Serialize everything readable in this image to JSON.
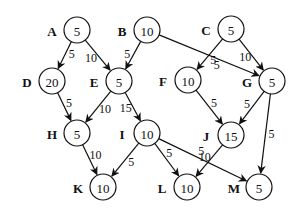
{
  "diagram": {
    "type": "directed-weighted-graph",
    "nodes": [
      {
        "id": "A",
        "label": "A",
        "value": "5"
      },
      {
        "id": "B",
        "label": "B",
        "value": "10"
      },
      {
        "id": "C",
        "label": "C",
        "value": "5"
      },
      {
        "id": "D",
        "label": "D",
        "value": "20"
      },
      {
        "id": "E",
        "label": "E",
        "value": "5"
      },
      {
        "id": "F",
        "label": "F",
        "value": "10"
      },
      {
        "id": "G",
        "label": "G",
        "value": "5"
      },
      {
        "id": "H",
        "label": "H",
        "value": "5"
      },
      {
        "id": "I",
        "label": "I",
        "value": "10"
      },
      {
        "id": "J",
        "label": "J",
        "value": "15"
      },
      {
        "id": "K",
        "label": "K",
        "value": "10"
      },
      {
        "id": "L",
        "label": "L",
        "value": "10"
      },
      {
        "id": "M",
        "label": "M",
        "value": "5"
      }
    ],
    "edges": [
      {
        "from": "A",
        "to": "D",
        "weight": "5"
      },
      {
        "from": "A",
        "to": "E",
        "weight": "10"
      },
      {
        "from": "B",
        "to": "E",
        "weight": "5"
      },
      {
        "from": "B",
        "to": "G",
        "weight": "5"
      },
      {
        "from": "C",
        "to": "F",
        "weight": "5"
      },
      {
        "from": "C",
        "to": "G",
        "weight": "10"
      },
      {
        "from": "D",
        "to": "H",
        "weight": "5"
      },
      {
        "from": "E",
        "to": "H",
        "weight": "10"
      },
      {
        "from": "E",
        "to": "I",
        "weight": "15"
      },
      {
        "from": "F",
        "to": "J",
        "weight": "5"
      },
      {
        "from": "G",
        "to": "J",
        "weight": "5"
      },
      {
        "from": "G",
        "to": "M",
        "weight": "5"
      },
      {
        "from": "H",
        "to": "K",
        "weight": "10"
      },
      {
        "from": "I",
        "to": "K",
        "weight": "5"
      },
      {
        "from": "I",
        "to": "L",
        "weight": "5"
      },
      {
        "from": "I",
        "to": "M",
        "weight": "5"
      },
      {
        "from": "J",
        "to": "L",
        "weight": "10"
      }
    ]
  }
}
